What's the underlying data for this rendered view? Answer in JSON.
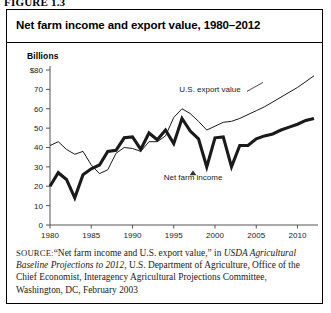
{
  "figure": {
    "number_label": "FIGURE 1.3",
    "title": "Net farm income and export value, 1980–2012"
  },
  "source": {
    "kicker": "SOURCE:",
    "text_part1": "“Net farm income and U.S. export value,” in ",
    "italic_part": "USDA Agricultural Baseline Projections to 2012",
    "text_part2": ", U.S. Department of Agriculture, Office of the Chief Economist, Interagency Agricultural Projections Committee, Washington, DC, February 2003"
  },
  "chart_data": {
    "type": "line",
    "title": "Net farm income and export value, 1980–2012",
    "unit_label": "Billions",
    "xlabel": "",
    "ylabel": "Billions",
    "xlim": [
      1980,
      2012
    ],
    "ylim": [
      0,
      80
    ],
    "ytick_labels": [
      "$80",
      "70",
      "60",
      "50",
      "40",
      "30",
      "20",
      "10",
      "0"
    ],
    "ytick_values": [
      80,
      70,
      60,
      50,
      40,
      30,
      20,
      10,
      0
    ],
    "xtick_labels": [
      "1980",
      "1985",
      "1990",
      "1995",
      "2000",
      "2005",
      "2010"
    ],
    "xtick_values": [
      1980,
      1985,
      1990,
      1995,
      2000,
      2005,
      2010
    ],
    "grid": false,
    "legend_position": "inline-annotation",
    "annotations": [
      {
        "name": "U.S. export value",
        "x": 2000,
        "y": 70
      },
      {
        "name": "Net farm income",
        "x": 2000,
        "y": 25
      }
    ],
    "x": [
      1980,
      1981,
      1982,
      1983,
      1984,
      1985,
      1986,
      1987,
      1988,
      1989,
      1990,
      1991,
      1992,
      1993,
      1994,
      1995,
      1996,
      1997,
      1998,
      1999,
      2000,
      2001,
      2002,
      2003,
      2004,
      2005,
      2006,
      2007,
      2008,
      2009,
      2010,
      2011,
      2012
    ],
    "series": [
      {
        "name": "U.S. export value",
        "style": "thin",
        "values": [
          41.0,
          43.0,
          39.0,
          36.5,
          38.0,
          31.0,
          26.5,
          28.5,
          37.0,
          40.0,
          39.5,
          38.0,
          43.0,
          43.0,
          46.0,
          55.5,
          60.0,
          57.5,
          53.5,
          49.0,
          51.0,
          53.0,
          53.5,
          55.0,
          57.0,
          59.0,
          61.0,
          63.5,
          66.0,
          68.5,
          71.0,
          74.0,
          77.0
        ]
      },
      {
        "name": "Net farm income",
        "style": "thick",
        "values": [
          20.0,
          27.0,
          23.5,
          14.0,
          26.0,
          29.0,
          31.0,
          38.0,
          38.5,
          45.0,
          45.5,
          39.0,
          47.5,
          44.0,
          49.0,
          42.0,
          55.0,
          48.5,
          44.5,
          30.0,
          45.0,
          45.5,
          30.0,
          41.0,
          41.0,
          44.5,
          46.0,
          47.0,
          49.0,
          50.5,
          52.0,
          54.0,
          55.0
        ]
      }
    ]
  }
}
